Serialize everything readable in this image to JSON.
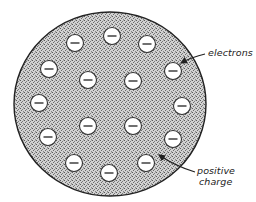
{
  "diagram": {
    "atom": {
      "center": [
        110,
        104
      ],
      "radii": [
        96,
        92
      ],
      "outline_color": "#222222",
      "fill_color": "#c4c4c4",
      "stipple_color": "#6a6a6a"
    },
    "electron_symbol": "−",
    "electron_radius": 8.5,
    "electrons": [
      {
        "x": 112,
        "y": 36
      },
      {
        "x": 75,
        "y": 43
      },
      {
        "x": 147,
        "y": 44
      },
      {
        "x": 49,
        "y": 69
      },
      {
        "x": 173,
        "y": 71
      },
      {
        "x": 88,
        "y": 80
      },
      {
        "x": 133,
        "y": 81
      },
      {
        "x": 39,
        "y": 103
      },
      {
        "x": 182,
        "y": 106
      },
      {
        "x": 88,
        "y": 126
      },
      {
        "x": 133,
        "y": 126
      },
      {
        "x": 48,
        "y": 137
      },
      {
        "x": 173,
        "y": 139
      },
      {
        "x": 74,
        "y": 163
      },
      {
        "x": 146,
        "y": 163
      },
      {
        "x": 109,
        "y": 173
      }
    ],
    "labels": {
      "electrons": "electrons",
      "positive_line1": "positive",
      "positive_line2": "charge"
    }
  }
}
